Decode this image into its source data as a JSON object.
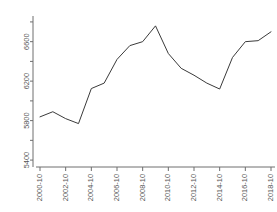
{
  "chart_data": {
    "type": "line",
    "title": "",
    "subtitle": "",
    "xlabel": "",
    "ylabel": "",
    "grid": false,
    "legend": null,
    "x": [
      "2000-10",
      "2001-10",
      "2002-10",
      "2003-10",
      "2004-10",
      "2005-10",
      "2006-10",
      "2007-10",
      "2008-10",
      "2009-10",
      "2010-10",
      "2011-10",
      "2012-10",
      "2013-10",
      "2014-10",
      "2015-10",
      "2016-10",
      "2017-10",
      "2018-10"
    ],
    "xtick_labels": [
      "2000-10",
      "2002-10",
      "2004-10",
      "2006-10",
      "2008-10",
      "2010-10",
      "2012-10",
      "2014-10",
      "2016-10",
      "2018-10"
    ],
    "ytick_labels": [
      "5400",
      "5800",
      "6200",
      "6600"
    ],
    "ytick_values": [
      5400,
      5800,
      6200,
      6600
    ],
    "yminor_values": [
      5600,
      6000,
      6400,
      6800
    ],
    "ylim": [
      5330,
      6860
    ],
    "values": [
      5838,
      5890,
      5820,
      5770,
      6125,
      6180,
      6420,
      6560,
      6600,
      6760,
      6480,
      6330,
      6260,
      6180,
      6120,
      6440,
      6600,
      6610,
      6700
    ],
    "series": [
      {
        "name": "series-1",
        "color": "#3a3a3a",
        "values": [
          5838,
          5890,
          5820,
          5770,
          6125,
          6180,
          6420,
          6560,
          6600,
          6760,
          6480,
          6330,
          6260,
          6180,
          6120,
          6440,
          6600,
          6610,
          6700
        ]
      }
    ]
  },
  "axes": {
    "y_label_rotation": "-90",
    "x_label_rotation": "-90",
    "axis_color": "#6e6e6e",
    "line_color": "#3a3a3a"
  }
}
